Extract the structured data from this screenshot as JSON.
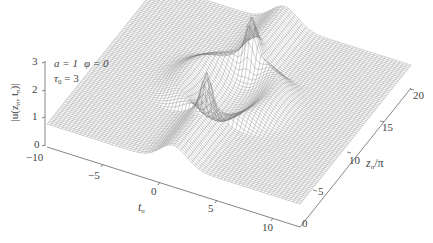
{
  "chart_data": {
    "type": "surface3d",
    "title": "",
    "annotations": [
      "a = 1",
      "φ = 0",
      "τ0 = 3"
    ],
    "params": {
      "a": 1,
      "phi": 0,
      "tau0": 3
    },
    "xlabel": "t_n",
    "ylabel": "z_n/π",
    "zlabel": "|u(z_n, t_n)|",
    "x_ticks": [
      -10,
      -5,
      0,
      5,
      10
    ],
    "y_ticks": [
      0,
      5,
      10,
      15,
      20
    ],
    "z_ticks": [
      0,
      1,
      2,
      3
    ],
    "xlim": [
      -10,
      10
    ],
    "ylim": [
      0,
      20
    ],
    "zlim": [
      0,
      3
    ],
    "grid": false,
    "peaks": [
      {
        "t_n": 0,
        "z_over_pi": 6,
        "height": 2.4
      },
      {
        "t_n": 0,
        "z_over_pi": 14,
        "height": 2.4
      }
    ],
    "background_level": 0.9,
    "mesh_color": "#7a7a7a"
  },
  "labels": {
    "z_axis": "|u(z",
    "z_axis_sub1": "n",
    "z_axis_mid": ", t",
    "z_axis_sub2": "n",
    "z_axis_end": ")|",
    "x_axis": "t",
    "x_axis_sub": "n",
    "y_axis": "z",
    "y_axis_sub": "n",
    "y_axis_end": "/π",
    "param_a": "a = 1",
    "param_phi": "φ = 0",
    "param_tau": "τ",
    "param_tau_sub": "0",
    "param_tau_val": " = 3",
    "z_ticks": [
      "0",
      "1",
      "2",
      "3"
    ],
    "x_ticks": [
      "−10",
      "−5",
      "0",
      "5",
      "10"
    ],
    "y_ticks": [
      "0",
      "5",
      "10",
      "15",
      "20"
    ]
  }
}
